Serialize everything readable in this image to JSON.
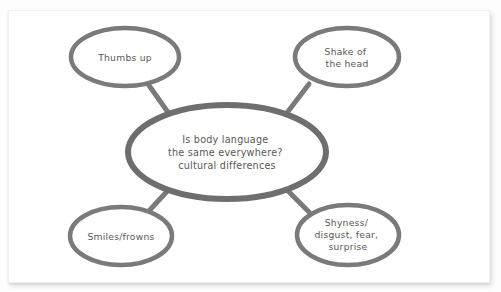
{
  "diagram": {
    "type": "mind-map",
    "title_node": {
      "id": "central",
      "lines": [
        "Is body language",
        "the same everywhere?",
        "cultural differences"
      ]
    },
    "branches": [
      {
        "id": "thumbs-up",
        "position": "top-left",
        "lines": [
          "Thumbs up"
        ]
      },
      {
        "id": "shake-of-the-head",
        "position": "top-right",
        "lines": [
          "Shake of",
          "the head"
        ]
      },
      {
        "id": "smiles-frowns",
        "position": "bottom-left",
        "lines": [
          "Smiles/frowns"
        ]
      },
      {
        "id": "shyness-disgust-fear-surprise",
        "position": "bottom-right",
        "lines": [
          "Shyness/",
          "disgust, fear,",
          "surprise"
        ]
      }
    ],
    "colors": {
      "stroke": "#7a7a7a",
      "central_stroke": "#6e6e6e",
      "text": "#585858",
      "node_fill": "#ffffff",
      "paper": "#ffffff",
      "background": "#fdfdfd"
    }
  }
}
